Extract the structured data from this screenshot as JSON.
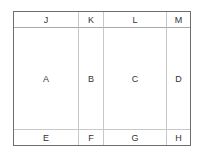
{
  "header_row": [
    "J",
    "K",
    "L",
    "M"
  ],
  "body_row": [
    "A",
    "B",
    "C",
    "D"
  ],
  "footer_row": [
    "E",
    "F",
    "G",
    "H"
  ]
}
